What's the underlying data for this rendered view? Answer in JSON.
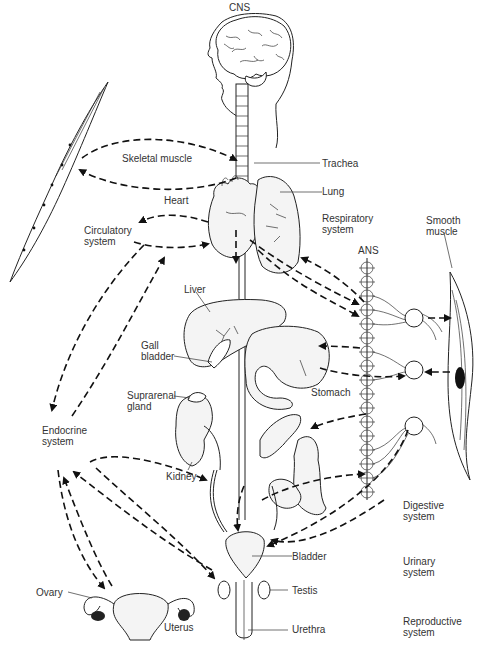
{
  "figure": {
    "title": "CNS",
    "labels": {
      "cns": "CNS",
      "skeletal_muscle": "Skeletal muscle",
      "trachea": "Trachea",
      "heart": "Heart",
      "lung": "Lung",
      "respiratory_system": "Respiratory\nsystem",
      "smooth_muscle": "Smooth\nmuscle",
      "circulatory_system": "Circulatory\nsystem",
      "ans": "ANS",
      "liver": "Liver",
      "gall_bladder": "Gall\nbladder",
      "stomach": "Stomach",
      "suprarenal_gland": "Suprarenal\ngland",
      "endocrine_system": "Endocrine\nsystem",
      "kidney": "Kidney",
      "digestive_system": "Digestive\nsystem",
      "bladder": "Bladder",
      "urinary_system": "Urinary\nsystem",
      "ovary": "Ovary",
      "testis": "Testis",
      "uterus": "Uterus",
      "urethra": "Urethra",
      "reproductive_system": "Reproductive\nsystem"
    }
  }
}
